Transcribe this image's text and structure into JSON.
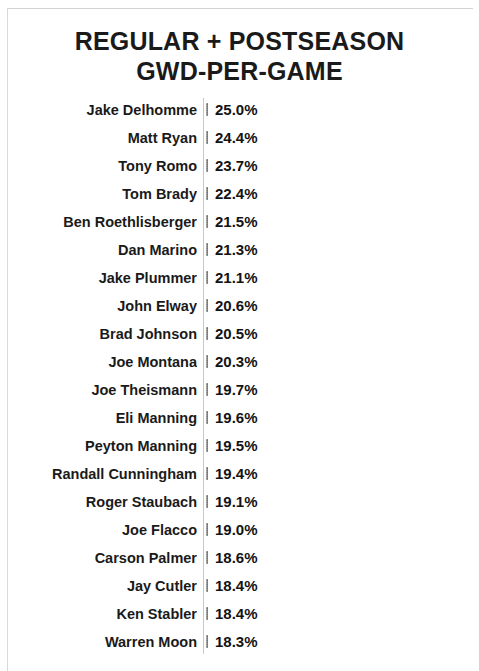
{
  "chart_title_lines": [
    "REGULAR + POSTSEASON",
    "GWD-PER-GAME"
  ],
  "chart_data": {
    "type": "bar",
    "orientation": "horizontal",
    "title": "REGULAR + POSTSEASON GWD-PER-GAME",
    "subtitle": "",
    "xlabel": "",
    "ylabel": "",
    "grid": false,
    "legend": "none",
    "axis_line": true,
    "value_suffix": "%",
    "xlim": [
      0,
      25.0
    ],
    "categories": [
      "Jake Delhomme",
      "Matt Ryan",
      "Tony Romo",
      "Tom Brady",
      "Ben Roethlisberger",
      "Dan Marino",
      "Jake Plummer",
      "John Elway",
      "Brad Johnson",
      "Joe Montana",
      "Joe Theismann",
      "Eli Manning",
      "Peyton Manning",
      "Randall Cunningham",
      "Roger Staubach",
      "Joe Flacco",
      "Carson Palmer",
      "Jay Cutler",
      "Ken Stabler",
      "Warren Moon"
    ],
    "values": [
      25.0,
      24.4,
      23.7,
      22.4,
      21.5,
      21.3,
      21.1,
      20.6,
      20.5,
      20.3,
      19.7,
      19.6,
      19.5,
      19.4,
      19.1,
      19.0,
      18.6,
      18.4,
      18.4,
      18.3
    ],
    "data_labels": [
      "25.0%",
      "24.4%",
      "23.7%",
      "22.4%",
      "21.5%",
      "21.3%",
      "21.1%",
      "20.6%",
      "20.5%",
      "20.3%",
      "19.7%",
      "19.6%",
      "19.5%",
      "19.4%",
      "19.1%",
      "19.0%",
      "18.6%",
      "18.4%",
      "18.4%",
      "18.3%"
    ],
    "colors": {
      "bar": "#8a8a8a",
      "text": "#1a1a1a",
      "axis_line": "#c8c8c8",
      "background": "#ffffff"
    }
  },
  "render": {
    "bar_area_left_px": 206,
    "bar_px_per_unit": 5.67,
    "bar_zero_offset_px": -255.8,
    "row_pitch_px": 28,
    "first_row_top_px": 0
  }
}
